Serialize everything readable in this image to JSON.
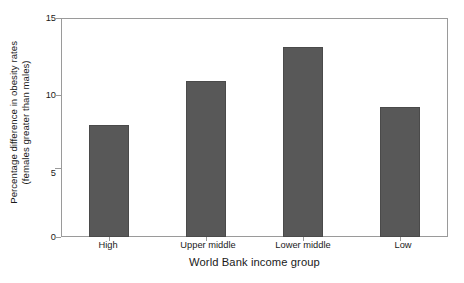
{
  "chart_data": {
    "type": "bar",
    "title": "",
    "xlabel": "World Bank income group",
    "ylabel_line1": "Percentage difference in obesity rates",
    "ylabel_line2": "(females greater than males)",
    "categories": [
      "High",
      "Upper middle",
      "Lower middle",
      "Low"
    ],
    "values": [
      7.7,
      10.7,
      13.0,
      8.9
    ],
    "ylim": [
      0,
      15
    ],
    "yticks": [
      0,
      5,
      10,
      15
    ],
    "ytick_labels": [
      "0",
      "5",
      "10",
      "15"
    ],
    "grid": false,
    "legend": false,
    "bar_color": "#585858",
    "bar_edge_color": "#4a4a4a",
    "axis_color": "#9a9a9a",
    "text_color": "#1a1a1a",
    "background": "#ffffff"
  }
}
